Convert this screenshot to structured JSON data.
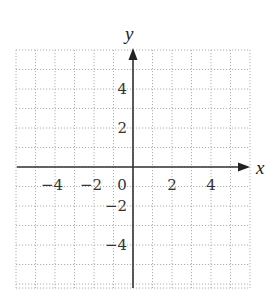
{
  "chart_data": {
    "type": "scatter",
    "title": "",
    "xlabel": "x",
    "ylabel": "y",
    "xlim": [
      -6,
      6
    ],
    "ylim": [
      -6,
      6
    ],
    "grid": true,
    "grid_style": "dotted",
    "x_ticks": [
      -4,
      -2,
      0,
      2,
      4
    ],
    "y_ticks": [
      4,
      2,
      -2,
      -4
    ],
    "x_tick_labels": [
      "−4",
      "−2",
      "0",
      "2",
      "4"
    ],
    "y_tick_labels": [
      "4",
      "2",
      "−2",
      "−4"
    ],
    "series": [],
    "legend": null
  },
  "colors": {
    "axis": "#333333",
    "grid": "#b0b0b0",
    "text": "#333333"
  }
}
